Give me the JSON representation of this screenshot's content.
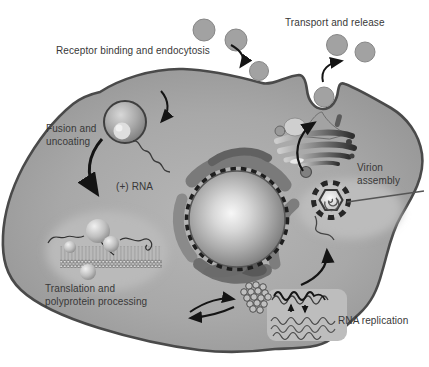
{
  "labels": {
    "receptor_binding": "Receptor binding and endocytosis",
    "transport_release": "Transport and release",
    "fusion_line1": "Fusion and",
    "fusion_line2": "uncoating",
    "plus_rna": "(+) RNA",
    "virion_line1": "Virion",
    "virion_line2": "assembly",
    "translation_line1": "Translation and",
    "translation_line2": "polyprotein processing",
    "rna_replication": "RNA replication"
  },
  "colors": {
    "background": "#ffffff",
    "cytoplasm": "#a7a7a7",
    "membrane_outline": "#4a4a4a",
    "nucleus_center": "#f6f6f6",
    "nucleus_edge": "#707070",
    "organelle_dark": "#5e5e5e",
    "light_region": "#bdbdbd",
    "virion_fill": "#a2a2a2",
    "arrow": "#141414",
    "text": "#383838"
  },
  "structures": [
    {
      "name": "virion-particle",
      "count": 6
    },
    {
      "name": "endosome-vesicle",
      "count": 1
    },
    {
      "name": "nucleus",
      "count": 1
    },
    {
      "name": "endoplasmic-reticulum-ring",
      "count": 1
    },
    {
      "name": "golgi-apparatus",
      "count": 1
    },
    {
      "name": "lipid-bilayer",
      "count": 1
    },
    {
      "name": "ribosome",
      "count": 4
    },
    {
      "name": "capsid-protein-cluster",
      "count": 1
    },
    {
      "name": "assembling-virion",
      "count": 1
    },
    {
      "name": "rna-strand-squiggle",
      "count": 2
    },
    {
      "name": "replication-intermediates-panel",
      "count": 1
    },
    {
      "name": "process-arrow",
      "count": 10
    }
  ]
}
